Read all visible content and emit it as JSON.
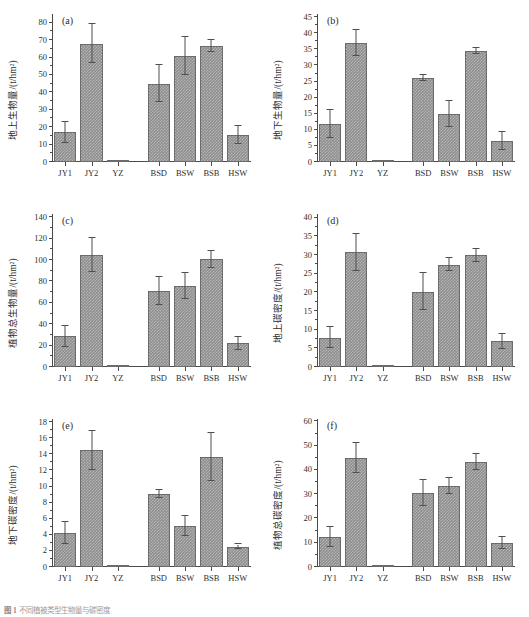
{
  "figure": {
    "caption_label": "图 1",
    "caption_text": "不同植被类型生物量与碳密度",
    "panel_count": 6
  },
  "categories": [
    "JY1",
    "JY2",
    "YZ",
    "BSD",
    "BSW",
    "BSB",
    "HSW"
  ],
  "style": {
    "bar_fill": "#8e8e8e",
    "bar_edge": "#6b6b6b",
    "axis_color": "#4a4a4a",
    "text_color": "#2f2f2f"
  },
  "chart_data": [
    {
      "type": "bar",
      "panel": "(a)",
      "title": "",
      "xlabel": "",
      "ylabel": "地上生物量/(t/hm²)",
      "categories": [
        "JY1",
        "JY2",
        "YZ",
        "BSD",
        "BSW",
        "BSB",
        "HSW"
      ],
      "values": [
        17.0,
        68.0,
        0.3,
        45.0,
        61.0,
        66.5,
        15.5
      ],
      "errors": [
        6.0,
        11.0,
        0.2,
        10.5,
        11.0,
        3.5,
        5.0
      ],
      "ylim": [
        0,
        85
      ],
      "yticks": [
        0,
        10,
        20,
        30,
        40,
        50,
        60,
        70,
        80
      ],
      "grid": false,
      "legend": "none"
    },
    {
      "type": "bar",
      "panel": "(b)",
      "title": "",
      "xlabel": "",
      "ylabel": "地下生物量/(t/hm²)",
      "categories": [
        "JY1",
        "JY2",
        "YZ",
        "BSD",
        "BSW",
        "BSB",
        "HSW"
      ],
      "values": [
        11.8,
        37.0,
        0.1,
        26.1,
        14.9,
        34.5,
        6.6
      ],
      "errors": [
        4.3,
        4.1,
        0.1,
        0.9,
        4.0,
        0.8,
        2.8
      ],
      "ylim": [
        0,
        46
      ],
      "yticks": [
        0,
        5,
        10,
        15,
        20,
        25,
        30,
        35,
        40,
        45
      ],
      "grid": false,
      "legend": "none"
    },
    {
      "type": "bar",
      "panel": "(c)",
      "title": "",
      "xlabel": "",
      "ylabel": "植物总生物量/(t/hm²)",
      "categories": [
        "JY1",
        "JY2",
        "YZ",
        "BSD",
        "BSW",
        "BSB",
        "HSW"
      ],
      "values": [
        28.8,
        105.0,
        0.4,
        71.0,
        75.5,
        100.5,
        22.0
      ],
      "errors": [
        9.7,
        16.0,
        0.3,
        13.2,
        12.0,
        7.5,
        6.0
      ],
      "ylim": [
        0,
        143
      ],
      "yticks": [
        0,
        20,
        40,
        60,
        80,
        100,
        120,
        140
      ],
      "grid": false,
      "legend": "none"
    },
    {
      "type": "bar",
      "panel": "(d)",
      "title": "",
      "xlabel": "",
      "ylabel": "地上碳密度/(t/hm²)",
      "categories": [
        "JY1",
        "JY2",
        "YZ",
        "BSD",
        "BSW",
        "BSB",
        "HSW"
      ],
      "values": [
        7.8,
        30.7,
        0.15,
        20.2,
        27.4,
        29.9,
        6.9
      ],
      "errors": [
        2.8,
        5.0,
        0.1,
        5.0,
        1.8,
        1.8,
        2.0
      ],
      "ylim": [
        0,
        41
      ],
      "yticks": [
        0,
        5,
        10,
        15,
        20,
        25,
        30,
        35,
        40
      ],
      "grid": false,
      "legend": "none"
    },
    {
      "type": "bar",
      "panel": "(e)",
      "title": "",
      "xlabel": "",
      "ylabel": "地下碳密度/(t/hm²)",
      "categories": [
        "JY1",
        "JY2",
        "YZ",
        "BSD",
        "BSW",
        "BSB",
        "HSW"
      ],
      "values": [
        4.2,
        14.5,
        0.05,
        9.1,
        5.1,
        13.7,
        2.5
      ],
      "errors": [
        1.4,
        2.4,
        0.05,
        0.5,
        1.2,
        3.0,
        0.3
      ],
      "ylim": [
        0,
        18.4
      ],
      "yticks": [
        0,
        2,
        4,
        6,
        8,
        10,
        12,
        14,
        16,
        18
      ],
      "grid": false,
      "legend": "none"
    },
    {
      "type": "bar",
      "panel": "(f)",
      "title": "",
      "xlabel": "",
      "ylabel": "植物总碳密度/(t/hm²)",
      "categories": [
        "JY1",
        "JY2",
        "YZ",
        "BSD",
        "BSW",
        "BSB",
        "HSW"
      ],
      "values": [
        12.3,
        45.0,
        0.2,
        30.5,
        33.3,
        43.4,
        9.9
      ],
      "errors": [
        4.0,
        6.3,
        0.15,
        5.3,
        3.3,
        3.3,
        2.5
      ],
      "ylim": [
        0,
        61
      ],
      "yticks": [
        0,
        10,
        20,
        30,
        40,
        50,
        60
      ],
      "grid": false,
      "legend": "none"
    }
  ]
}
